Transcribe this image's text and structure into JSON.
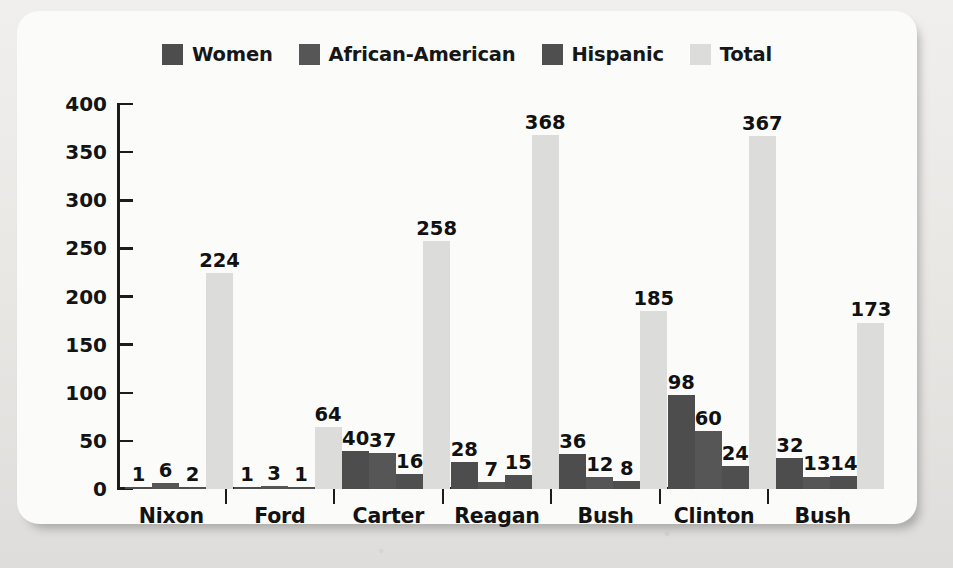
{
  "chart_data": {
    "type": "bar",
    "title": "",
    "xlabel": "",
    "ylabel": "",
    "ylim": [
      0,
      400
    ],
    "yticks": [
      0,
      50,
      100,
      150,
      200,
      250,
      300,
      350,
      400
    ],
    "grid": false,
    "legend_position": "top-center",
    "categories": [
      "Nixon",
      "Ford",
      "Carter",
      "Reagan",
      "Bush",
      "Clinton",
      "Bush"
    ],
    "series": [
      {
        "name": "Women",
        "color": "#4d4d4d",
        "values": [
          1,
          1,
          40,
          28,
          36,
          98,
          32
        ]
      },
      {
        "name": "African-American",
        "color": "#565656",
        "values": [
          6,
          3,
          37,
          7,
          12,
          60,
          13
        ]
      },
      {
        "name": "Hispanic",
        "color": "#4f4f4f",
        "values": [
          2,
          1,
          16,
          15,
          8,
          24,
          14
        ]
      },
      {
        "name": "Total",
        "color": "#dcdcda",
        "values": [
          224,
          64,
          258,
          368,
          185,
          367,
          173
        ]
      }
    ]
  },
  "legend": {
    "items": [
      {
        "label": "Women",
        "swatch": "#4d4d4d"
      },
      {
        "label": "African-American",
        "swatch": "#565656"
      },
      {
        "label": "Hispanic",
        "swatch": "#4f4f4f"
      },
      {
        "label": "Total",
        "swatch": "#dcdcda"
      }
    ]
  },
  "axis": {
    "y_tick_labels": [
      "400",
      "350",
      "300",
      "250",
      "200",
      "150",
      "100",
      "50",
      "0"
    ],
    "x_tick_labels": [
      "Nixon",
      "Ford",
      "Carter",
      "Reagan",
      "Bush",
      "Clinton",
      "Bush"
    ]
  }
}
